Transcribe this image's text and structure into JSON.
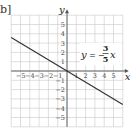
{
  "panel_label": "b]",
  "chart_data": {
    "type": "line",
    "title": "",
    "equation": "y = -3/5 x",
    "equation_parts": {
      "lhs": "y",
      "eq": "=",
      "sign": "−",
      "num": "3",
      "den": "5",
      "var": "x"
    },
    "xlabel": "x",
    "ylabel": "y",
    "xlim": [
      -6,
      6
    ],
    "ylim": [
      -6,
      6
    ],
    "grid": true,
    "x_ticks": [
      -5,
      -4,
      -3,
      -2,
      -1,
      1,
      2,
      3,
      4,
      5
    ],
    "y_ticks": [
      -5,
      -4,
      -3,
      -2,
      -1,
      1,
      2,
      3,
      4,
      5
    ],
    "series": [
      {
        "name": "y = -3/5 x",
        "slope": -0.6,
        "intercept": 0,
        "x": [
          -6,
          6
        ],
        "y": [
          3.6,
          -3.6
        ],
        "color": "#333333"
      }
    ]
  }
}
